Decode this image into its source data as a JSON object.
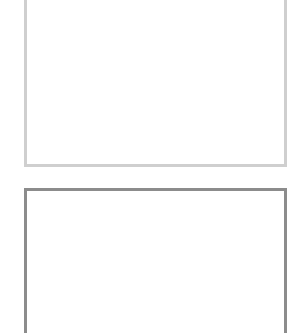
{
  "panels": [
    {
      "id": "top",
      "border_color": "#cfcfcf",
      "label": ""
    },
    {
      "id": "bottom",
      "border_color": "#8c8c8c",
      "label": ""
    }
  ]
}
